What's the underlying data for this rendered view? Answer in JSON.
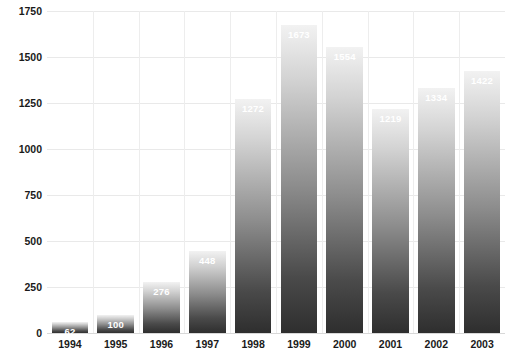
{
  "chart_data": {
    "type": "bar",
    "title": "",
    "subtitle": "",
    "xlabel": "",
    "ylabel": "",
    "categories": [
      "1994",
      "1995",
      "1996",
      "1997",
      "1998",
      "1999",
      "2000",
      "2001",
      "2002",
      "2003"
    ],
    "values": [
      62,
      100,
      276,
      448,
      1272,
      1673,
      1554,
      1219,
      1334,
      1422
    ],
    "data_labels": [
      "62",
      "100",
      "276",
      "448",
      "1272",
      "1673",
      "1554",
      "1219",
      "1334",
      "1422"
    ],
    "ylim": [
      0,
      1750
    ],
    "ytick_values": [
      0,
      250,
      500,
      750,
      1000,
      1250,
      1500,
      1750
    ],
    "ytick_labels": [
      "0",
      "250",
      "500",
      "750",
      "1000",
      "1250",
      "1500",
      "1750"
    ],
    "grid": true,
    "legend": "none",
    "series": [
      {
        "name": "series-1",
        "values": [
          62,
          100,
          276,
          448,
          1272,
          1673,
          1554,
          1219,
          1334,
          1422
        ]
      }
    ],
    "style": {
      "bar_gradient_top": "#f2f2f2",
      "bar_gradient_bottom": "#2e2e2e",
      "label_color": "#ffffff",
      "gridline_color": "#e9e9e9",
      "axis_text_color": "#1a1a1a",
      "background": "#ffffff"
    }
  }
}
